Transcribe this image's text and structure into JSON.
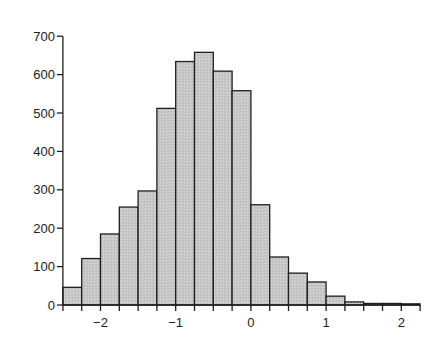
{
  "chart_data": {
    "type": "bar",
    "subtype": "histogram",
    "title": "",
    "xlabel": "",
    "ylabel": "",
    "bin_width": 0.25,
    "bin_edges": [
      -2.5,
      -2.25,
      -2.0,
      -1.75,
      -1.5,
      -1.25,
      -1.0,
      -0.75,
      -0.5,
      -0.25,
      0.0,
      0.25,
      0.5,
      0.75,
      1.0,
      1.25,
      1.5,
      1.75,
      2.0,
      2.25
    ],
    "categories": [
      "-2.5 to -2.25",
      "-2.25 to -2",
      "-2 to -1.75",
      "-1.75 to -1.5",
      "-1.5 to -1.25",
      "-1.25 to -1",
      "-1 to -0.75",
      "-0.75 to -0.5",
      "-0.5 to -0.25",
      "-0.25 to 0",
      "0 to 0.25",
      "0.25 to 0.5",
      "0.5 to 0.75",
      "0.75 to 1",
      "1 to 1.25",
      "1.25 to 1.5",
      "1.5 to 1.75",
      "1.75 to 2",
      "2 to 2.25"
    ],
    "values": [
      46,
      121,
      185,
      255,
      297,
      512,
      634,
      658,
      609,
      558,
      261,
      125,
      83,
      60,
      23,
      8,
      4,
      4,
      3
    ],
    "xlim": [
      -2.5,
      2.25
    ],
    "ylim": [
      0,
      700
    ],
    "x_ticks": [
      -2,
      -1,
      0,
      1,
      2
    ],
    "x_tick_labels": [
      "−2",
      "−1",
      "0",
      "1",
      "2"
    ],
    "x_minor_tick_step": 0.25,
    "y_ticks": [
      0,
      100,
      200,
      300,
      400,
      500,
      600,
      700
    ],
    "y_tick_labels": [
      "0",
      "100",
      "200",
      "300",
      "400",
      "500",
      "600",
      "700"
    ],
    "grid": false,
    "legend": null,
    "colors": {
      "bar_fill": "#c6c6c6",
      "bar_edge": "#1e1e1e",
      "axis": "#1e1e1e"
    }
  }
}
